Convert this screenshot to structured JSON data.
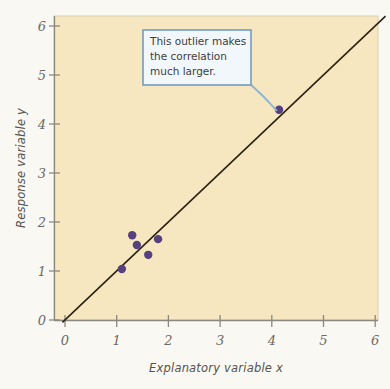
{
  "figure": {
    "plot_bg_color": "#f6e7c1",
    "page_bg_color": "#faf8f2",
    "line_color": "#2d2112",
    "point_color": "#56407e",
    "callout_border_color": "#6f9cc4",
    "callout_fill_color": "#f2f7fc",
    "leader_line_color": "#8fb4cf"
  },
  "annotations": [
    {
      "name": "outlier-callout",
      "lines": [
        "This outlier makes",
        "the correlation",
        "much larger."
      ],
      "text": "This outlier makes the correlation much larger."
    }
  ],
  "axis": {
    "x_tick_labels": [
      "0",
      "1",
      "2",
      "3",
      "4",
      "5",
      "6"
    ],
    "y_tick_labels": [
      "0",
      "1",
      "2",
      "3",
      "4",
      "5",
      "6"
    ]
  },
  "chart_data": {
    "type": "scatter",
    "title": "",
    "xlabel": "Explanatory variable x",
    "ylabel": "Response variable y",
    "xlim": [
      0,
      6.2
    ],
    "ylim": [
      0,
      6.2
    ],
    "xticks": [
      0,
      1,
      2,
      3,
      4,
      5,
      6
    ],
    "yticks": [
      0,
      1,
      2,
      3,
      4,
      5,
      6
    ],
    "grid": false,
    "legend": false,
    "series": [
      {
        "name": "observations",
        "color": "#56407e",
        "points": [
          {
            "x": 1.1,
            "y": 1.04
          },
          {
            "x": 1.3,
            "y": 1.73
          },
          {
            "x": 1.39,
            "y": 1.53
          },
          {
            "x": 1.61,
            "y": 1.33
          },
          {
            "x": 1.8,
            "y": 1.65
          },
          {
            "x": 4.14,
            "y": 4.29
          }
        ]
      }
    ],
    "reference_line": {
      "name": "regression-line",
      "color": "#2d2112",
      "x0": -0.05,
      "y0": -0.05,
      "x1": 6.2,
      "y1": 6.2
    },
    "annotations": [
      {
        "text": "This outlier makes the correlation much larger.",
        "target_x": 4.14,
        "target_y": 4.29
      }
    ]
  }
}
